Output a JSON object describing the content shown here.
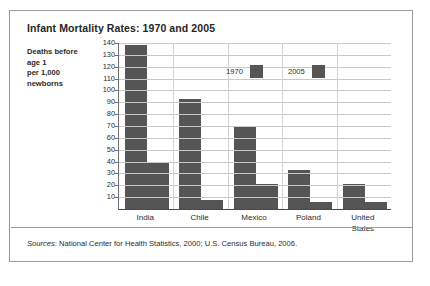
{
  "figure": {
    "title": "Infant Mortality Rates: 1970 and 2005",
    "axis_caption_lines": [
      "Deaths before",
      "age 1",
      "per 1,000",
      "newborns"
    ],
    "sources_prefix": "Sources",
    "sources_text": ": National Center for Health Statistics, 2000; U.S. Census Bureau, 2006.",
    "border_color": "#9a9a9a",
    "bar_color": "#555555",
    "grid_color": "#c9c9c9",
    "background": "#ffffff"
  },
  "chart_data": {
    "type": "bar",
    "title": "Infant Mortality Rates: 1970 and 2005",
    "xlabel": "",
    "ylabel": "Deaths before age 1 per 1,000 newborns",
    "categories": [
      "India",
      "Chile",
      "Mexico",
      "Poland",
      "United States"
    ],
    "series": [
      {
        "name": "1970",
        "values": [
          138,
          93,
          69,
          33,
          21
        ],
        "color": "#555555"
      },
      {
        "name": "2005",
        "values": [
          40,
          8,
          21,
          6,
          6
        ],
        "color": "#555555"
      }
    ],
    "ylim": [
      0,
      140
    ],
    "ytick_values": [
      140,
      130,
      120,
      110,
      100,
      90,
      80,
      70,
      60,
      50,
      40,
      30,
      20,
      10
    ],
    "ytick_labels": [
      "140",
      "130",
      "120",
      "110",
      "100",
      "90",
      "80",
      "70",
      "60",
      "50",
      "40",
      "30",
      "20",
      "10"
    ],
    "grid": "horizontal-and-vertical",
    "legend_position": "inside-top-center",
    "legend_entries": [
      "1970",
      "2005"
    ],
    "category_label_lines": [
      [
        "India"
      ],
      [
        "Chile"
      ],
      [
        "Mexico"
      ],
      [
        "Poland"
      ],
      [
        "United",
        "States"
      ]
    ]
  }
}
